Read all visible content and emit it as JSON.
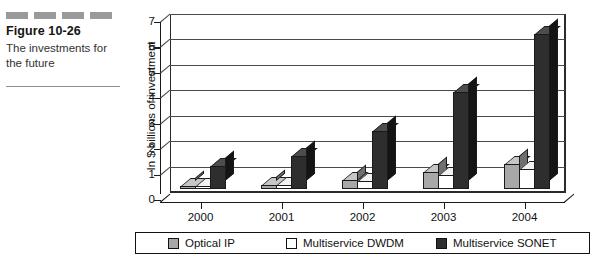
{
  "caption": {
    "figure_number": "Figure 10-26",
    "caption_text": "The investments for the future",
    "decor_dash_count": 4,
    "decor_dash_color": "#9a9a9a"
  },
  "chart_data": {
    "type": "bar",
    "title": "",
    "xlabel": "",
    "ylabel": "In $ billions of investment",
    "categories": [
      "2000",
      "2001",
      "2002",
      "2003",
      "2004"
    ],
    "series": [
      {
        "name": "Optical IP",
        "color": "#a8a8a8",
        "values": [
          0.1,
          0.15,
          0.35,
          0.65,
          1.0
        ]
      },
      {
        "name": "Multiservice DWDM",
        "color": "#ffffff",
        "values": [
          0.1,
          0.15,
          0.3,
          0.55,
          0.8
        ]
      },
      {
        "name": "Multiservice SONET",
        "color": "#2e2e2e",
        "values": [
          0.9,
          1.3,
          2.3,
          3.8,
          6.1
        ]
      }
    ],
    "ylim": [
      0,
      7
    ],
    "yticks": [
      0,
      1,
      2,
      3,
      4,
      5,
      6,
      7
    ],
    "ytick_labels": [
      "0",
      "1",
      "2",
      "3",
      "4",
      "5",
      "6",
      "7"
    ],
    "grid": true,
    "legend_position": "bottom",
    "three_d": true
  }
}
